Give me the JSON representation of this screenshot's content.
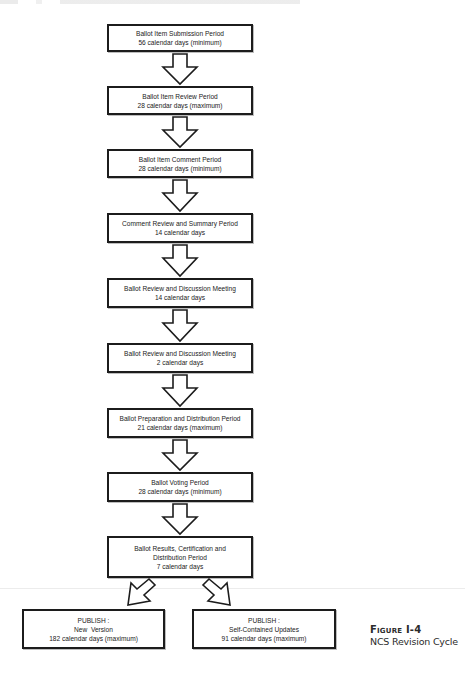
{
  "diagram": {
    "type": "flowchart",
    "steps": [
      {
        "title": "Ballot Item Submission Period",
        "lines": [
          "Ballot Item Submission Period",
          "56 calendar days (minimum)"
        ]
      },
      {
        "title": "Ballot Item Review Period",
        "lines": [
          "Ballot Item Review Period",
          "28 calendar days (maximum)"
        ]
      },
      {
        "title": "Ballot Item Comment Period",
        "lines": [
          "Ballot Item Comment Period",
          "28 calendar days (minimum)"
        ]
      },
      {
        "title": "Comment Review and Summary Period",
        "lines": [
          "Comment Review and Summary Period",
          "14 calendar days"
        ]
      },
      {
        "title": "Ballot Review and Discussion Meeting",
        "lines": [
          "Ballot Review and Discussion Meeting",
          "14 calendar days"
        ]
      },
      {
        "title": "Ballot Review and Discussion Meeting",
        "lines": [
          "Ballot Review and Discussion Meeting",
          "2 calendar days"
        ]
      },
      {
        "title": "Ballot Preparation and Distribution Period",
        "lines": [
          "Ballot Preparation and Distribution Period",
          "21 calendar days (maximum)"
        ]
      },
      {
        "title": "Ballot Voting Period",
        "lines": [
          "Ballot Voting Period",
          "28 calendar days (minimum)"
        ]
      },
      {
        "title": "Ballot Results, Certification and Distribution Period",
        "lines": [
          "Ballot Results, Certification and",
          "Distribution Period",
          "7 calendar days"
        ]
      }
    ],
    "outcomes": [
      {
        "lines": [
          "PUBLISH :",
          "New  Version",
          "182 calendar days (maximum)"
        ]
      },
      {
        "lines": [
          "PUBLISH :",
          "Self-Contained Updates",
          "91 calendar days (maximum)"
        ]
      }
    ],
    "edges": [
      [
        "step-1",
        "step-2"
      ],
      [
        "step-2",
        "step-3"
      ],
      [
        "step-3",
        "step-4"
      ],
      [
        "step-4",
        "step-5"
      ],
      [
        "step-5",
        "step-6"
      ],
      [
        "step-6",
        "step-7"
      ],
      [
        "step-7",
        "step-8"
      ],
      [
        "step-8",
        "step-9"
      ],
      [
        "step-9",
        "outcome-1"
      ],
      [
        "step-9",
        "outcome-2"
      ]
    ]
  },
  "caption": {
    "figure_label": "Figure I-4",
    "title": "NCS Revision Cycle"
  },
  "colors": {
    "box_border": "#1c1c1c",
    "arrow_stroke": "#1c1c1c",
    "background": "#ffffff"
  }
}
